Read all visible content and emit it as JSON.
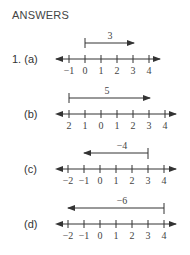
{
  "heading": "ANSWERS",
  "problem_number": "1.",
  "parts": [
    {
      "label": "(a)",
      "tick_labels": [
        "−1",
        "0",
        "1",
        "2",
        "3",
        "4"
      ],
      "vector_label": "3",
      "vector_from": 0,
      "vector_to": 3
    },
    {
      "label": "(b)",
      "tick_labels": [
        "2",
        "1",
        "0",
        "1",
        "2",
        "3",
        "4"
      ],
      "vector_label": "5",
      "vector_from": -2,
      "vector_to": 3
    },
    {
      "label": "(c)",
      "tick_labels": [
        "−2",
        "−1",
        "0",
        "1",
        "2",
        "3",
        "4"
      ],
      "vector_label": "−4",
      "vector_from": 3,
      "vector_to": -1
    },
    {
      "label": "(d)",
      "tick_labels": [
        "−2",
        "−1",
        "0",
        "1",
        "2",
        "3",
        "4"
      ],
      "vector_label": "−6",
      "vector_from": 4,
      "vector_to": -2
    }
  ]
}
